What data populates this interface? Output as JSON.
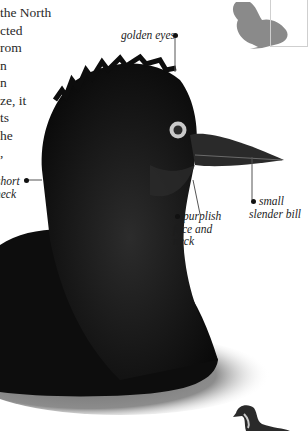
{
  "body_text": {
    "lines": [
      "the North",
      "cted",
      "rom",
      "n",
      "n",
      "ze, it",
      "ts",
      "he",
      ","
    ]
  },
  "labels": {
    "golden_eyes": "golden eyes",
    "short_neck": [
      "short",
      "neck"
    ],
    "purplish_face": [
      "purplish",
      "face and",
      "neck"
    ],
    "small_bill": [
      "small",
      "slender bill"
    ]
  },
  "colors": {
    "silhouette": "#8a8a8a",
    "bird": "#0e0e0e",
    "eye_ring": "#cfcfcf",
    "water": "#7a7a7a"
  }
}
